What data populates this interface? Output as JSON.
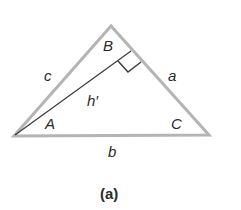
{
  "figure": {
    "caption": "(a)",
    "vertices": {
      "A": {
        "label": "A"
      },
      "B": {
        "label": "B"
      },
      "C": {
        "label": "C"
      }
    },
    "sides": {
      "a": "a",
      "b": "b",
      "c": "c"
    },
    "altitude": {
      "label": "h′"
    },
    "colors": {
      "triangle_stroke": "#b4b4b4",
      "altitude_stroke": "#3a3a3a",
      "text": "#2a2a2a"
    }
  }
}
